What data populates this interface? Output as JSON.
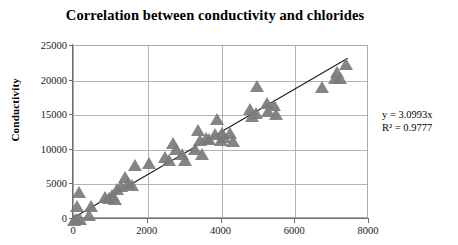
{
  "chart": {
    "title": "Correlation between conductivity and chlorides",
    "annotation": {
      "equation": "y = 3.0993x",
      "r2": "R² = 0.9777"
    },
    "axes": {
      "y_title": "Conductivity",
      "x_title": "",
      "y_ticks": [
        "0",
        "5000",
        "10000",
        "15000",
        "20000",
        "25000"
      ],
      "x_ticks": [
        "0",
        "2000",
        "4000",
        "6000",
        "8000"
      ]
    }
  },
  "chart_data": {
    "type": "scatter",
    "title": "Correlation between conductivity and chlorides",
    "xlabel": "",
    "ylabel": "Conductivity",
    "xlim": [
      0,
      8000
    ],
    "ylim": [
      0,
      25000
    ],
    "grid": true,
    "legend": false,
    "marker": "triangle",
    "marker_color": "#7b7b7b",
    "annotations": [
      "y = 3.0993x",
      "R² = 0.9777"
    ],
    "trendline": {
      "type": "linear",
      "slope": 3.0993,
      "intercept": 0,
      "r_squared": 0.9777,
      "x_start": 0,
      "x_end": 7450,
      "color": "#1a1a1a"
    },
    "series": [
      {
        "name": "Conductivity vs chlorides",
        "points": [
          [
            40,
            -600
          ],
          [
            80,
            -500
          ],
          [
            120,
            1500
          ],
          [
            150,
            3500
          ],
          [
            200,
            -400
          ],
          [
            430,
            200
          ],
          [
            500,
            1400
          ],
          [
            880,
            2700
          ],
          [
            980,
            2600
          ],
          [
            1050,
            3100
          ],
          [
            1150,
            2400
          ],
          [
            1200,
            3900
          ],
          [
            1300,
            4300
          ],
          [
            1420,
            5600
          ],
          [
            1500,
            4700
          ],
          [
            1600,
            4500
          ],
          [
            1680,
            7300
          ],
          [
            2050,
            7700
          ],
          [
            2500,
            8500
          ],
          [
            2600,
            8100
          ],
          [
            2720,
            10500
          ],
          [
            2800,
            9700
          ],
          [
            2950,
            9000
          ],
          [
            3050,
            8100
          ],
          [
            3300,
            9700
          ],
          [
            3400,
            12500
          ],
          [
            3450,
            11000
          ],
          [
            3500,
            9000
          ],
          [
            3600,
            11200
          ],
          [
            3700,
            11100
          ],
          [
            3850,
            11900
          ],
          [
            3900,
            14000
          ],
          [
            4000,
            11000
          ],
          [
            4050,
            12000
          ],
          [
            4100,
            11400
          ],
          [
            4250,
            12000
          ],
          [
            4350,
            10800
          ],
          [
            4800,
            15500
          ],
          [
            4850,
            14500
          ],
          [
            4950,
            14900
          ],
          [
            5000,
            18800
          ],
          [
            5250,
            16400
          ],
          [
            5300,
            15200
          ],
          [
            5450,
            16000
          ],
          [
            5500,
            14800
          ],
          [
            6750,
            18700
          ],
          [
            7100,
            20000
          ],
          [
            7150,
            20800
          ],
          [
            7250,
            19900
          ],
          [
            7400,
            22000
          ]
        ]
      }
    ]
  }
}
